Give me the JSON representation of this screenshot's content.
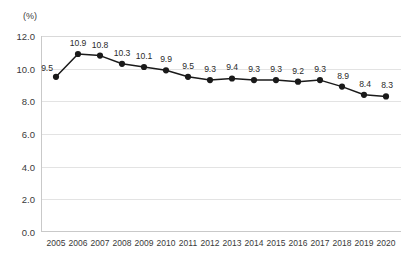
{
  "chart_data": {
    "type": "line",
    "title": "",
    "subtitle": "",
    "xlabel": "",
    "ylabel": "",
    "unit_label": "(%)",
    "categories": [
      "2005",
      "2006",
      "2007",
      "2008",
      "2009",
      "2010",
      "2011",
      "2012",
      "2013",
      "2014",
      "2015",
      "2016",
      "2017",
      "2018",
      "2019",
      "2020"
    ],
    "values": [
      9.5,
      10.9,
      10.8,
      10.3,
      10.1,
      9.9,
      9.5,
      9.3,
      9.4,
      9.3,
      9.3,
      9.2,
      9.3,
      8.9,
      8.4,
      8.3
    ],
    "point_labels": [
      "9.5",
      "10.9",
      "10.8",
      "10.3",
      "10.1",
      "9.9",
      "9.5",
      "9.3",
      "9.4",
      "9.3",
      "9.3",
      "9.2",
      "9.3",
      "8.9",
      "8.4",
      "8.3"
    ],
    "ylim": [
      0.0,
      12.0
    ],
    "ytick_step": 2.0,
    "yticks": [
      "12.0",
      "10.0",
      "8.0",
      "6.0",
      "4.0",
      "2.0",
      "0.0"
    ],
    "ytick_values": [
      12.0,
      10.0,
      8.0,
      6.0,
      4.0,
      2.0,
      0.0
    ],
    "grid": true,
    "legend": null,
    "legend_position": "none",
    "series_color": "#1a1a1a",
    "grid_color": "#e3e3e3",
    "axis_color": "#c9c9c9",
    "marker": "circle",
    "show_data_labels": true
  }
}
